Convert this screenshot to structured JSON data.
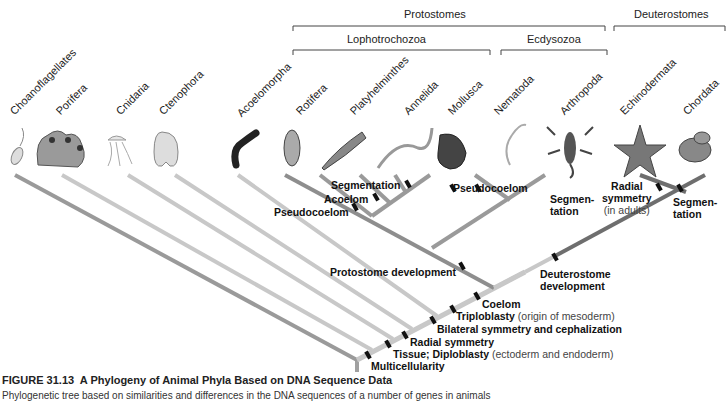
{
  "groups": {
    "protostomes": "Protostomes",
    "deuterostomes": "Deuterostomes",
    "lophotrochozoa": "Lophotrochozoa",
    "ecdysozoa": "Ecdysozoa"
  },
  "taxa": [
    {
      "name": "Choanoflagellates",
      "icon": "choanoflagellate-icon"
    },
    {
      "name": "Porifera",
      "icon": "sponge-icon"
    },
    {
      "name": "Cnidaria",
      "icon": "jellyfish-icon"
    },
    {
      "name": "Ctenophora",
      "icon": "comb-jelly-icon"
    },
    {
      "name": "Acoelomorpha",
      "icon": "acoel-worm-icon"
    },
    {
      "name": "Rotifera",
      "icon": "rotifer-icon"
    },
    {
      "name": "Platyhelminthes",
      "icon": "flatworm-icon"
    },
    {
      "name": "Annelida",
      "icon": "segmented-worm-icon"
    },
    {
      "name": "Mollusca",
      "icon": "mollusc-shell-icon"
    },
    {
      "name": "Nematoda",
      "icon": "roundworm-icon"
    },
    {
      "name": "Arthropoda",
      "icon": "scorpion-icon"
    },
    {
      "name": "Echinodermata",
      "icon": "starfish-icon"
    },
    {
      "name": "Chordata",
      "icon": "frog-icon"
    }
  ],
  "traits": {
    "segmentation_lopho": "Segmentation",
    "acoelom": "Acoelom",
    "pseudocoelom_rotifera": "Pseudocoelom",
    "pseudocoelom_nematoda": "Pseudocoelom",
    "segmentation_arthropoda_1": "Segmen-",
    "segmentation_arthropoda_2": "tation",
    "radial_adults_1": "Radial",
    "radial_adults_2": "symmetry",
    "radial_adults_3": "(in adults)",
    "segmentation_chordata_1": "Segmen-",
    "segmentation_chordata_2": "tation",
    "protostome_dev": "Protostome development",
    "deuterostome_dev_1": "Deuterostome",
    "deuterostome_dev_2": "development",
    "coelom": "Coelom",
    "triploblasty": "Triploblasty",
    "triploblasty_note": "(origin of mesoderm)",
    "bilateral": "Bilateral symmetry and cephalization",
    "radial": "Radial symmetry",
    "tissue": "Tissue; Diploblasty",
    "tissue_note": "(ectoderm and endoderm)",
    "multicellularity": "Multicellularity"
  },
  "caption": {
    "figure_number": "FIGURE 31.13",
    "title": "A Phylogeny of Animal Phyla Based on DNA Sequence Data",
    "body": "Phylogenetic tree based on similarities and differences in the DNA sequences of a number of genes in animals"
  },
  "colors": {
    "branch_light": "#c8c8c8",
    "branch_mid": "#9a9a9a",
    "branch_dark": "#6e6e6e",
    "tick": "#111111"
  }
}
